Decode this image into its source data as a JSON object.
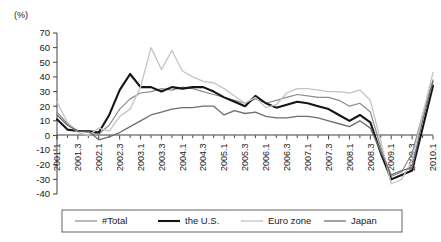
{
  "chart_data": {
    "type": "line",
    "title": "",
    "subtitle": "",
    "xlabel": "",
    "ylabel": "",
    "yunit": "(%)",
    "ylim": [
      -40,
      70
    ],
    "ytick_labels": [
      "70",
      "60",
      "50",
      "40",
      "30",
      "20",
      "10",
      "0",
      "-10",
      "-20",
      "-30",
      "-40"
    ],
    "ytick_values": [
      70,
      60,
      50,
      40,
      30,
      20,
      10,
      0,
      -10,
      -20,
      -30,
      -40
    ],
    "grid": false,
    "legend_position": "bottom",
    "categories": [
      "2001.1",
      "2001.2",
      "2001.3",
      "2001.4",
      "2002.1",
      "2002.2",
      "2002.3",
      "2002.4",
      "2003.1",
      "2003.2",
      "2003.3",
      "2003.4",
      "2004.1",
      "2004.2",
      "2004.3",
      "2004.4",
      "2005.1",
      "2005.2",
      "2005.3",
      "2005.4",
      "2006.1",
      "2006.2",
      "2006.3",
      "2006.4",
      "2007.1",
      "2007.2",
      "2007.3",
      "2007.4",
      "2008.1",
      "2008.2",
      "2008.3",
      "2008.4",
      "2009.1",
      "2009.2",
      "2009.3",
      "2009.4",
      "2010.1"
    ],
    "xtick_labels": [
      "2001.1",
      "2001.3",
      "2002.1",
      "2002.3",
      "2003.1",
      "2003.3",
      "2004.1",
      "2004.3",
      "2005.1",
      "2005.3",
      "2006.1",
      "2006.3",
      "2007.1",
      "2007.3",
      "2008.1",
      "2008.3",
      "2009.1",
      "2009.3",
      "2010.1"
    ],
    "series": [
      {
        "name": "#Total",
        "color": "#8c8c8c",
        "width": 1.2,
        "values": [
          16,
          8,
          3,
          2,
          1,
          7,
          18,
          25,
          29,
          30,
          32,
          31,
          33,
          32,
          30,
          28,
          26,
          24,
          22,
          25,
          22,
          24,
          26,
          28,
          27,
          26,
          26,
          24,
          20,
          22,
          16,
          -8,
          -28,
          -25,
          -12,
          14,
          38
        ]
      },
      {
        "name": "the U.S.",
        "color": "#141414",
        "width": 2.1,
        "values": [
          11,
          4,
          3,
          3,
          2,
          14,
          31,
          42,
          33,
          33,
          30,
          33,
          32,
          33,
          33,
          30,
          26,
          23,
          20,
          27,
          22,
          19,
          21,
          23,
          22,
          20,
          18,
          14,
          10,
          14,
          9,
          -12,
          -30,
          -27,
          -24,
          5,
          34
        ]
      },
      {
        "name": "Euro zone",
        "color": "#c4c4c4",
        "width": 1.3,
        "values": [
          23,
          9,
          2,
          0,
          5,
          3,
          13,
          18,
          33,
          60,
          45,
          58,
          44,
          40,
          37,
          36,
          32,
          27,
          22,
          26,
          19,
          21,
          29,
          32,
          32,
          31,
          30,
          30,
          29,
          31,
          24,
          -4,
          -33,
          -30,
          -17,
          14,
          43
        ]
      },
      {
        "name": "Japan",
        "color": "#6e6e6e",
        "width": 1.3,
        "values": [
          14,
          7,
          3,
          3,
          -3,
          -1,
          2,
          6,
          10,
          14,
          16,
          18,
          19,
          19,
          20,
          20,
          14,
          17,
          15,
          16,
          13,
          12,
          12,
          13,
          13,
          12,
          10,
          8,
          6,
          10,
          5,
          -11,
          -27,
          -24,
          -22,
          10,
          37
        ]
      }
    ],
    "legend": [
      {
        "label": "#Total",
        "color": "#8c8c8c",
        "width": 1.2
      },
      {
        "label": "the U.S.",
        "color": "#141414",
        "width": 2.1
      },
      {
        "label": "Euro zone",
        "color": "#c4c4c4",
        "width": 1.3
      },
      {
        "label": "Japan",
        "color": "#6e6e6e",
        "width": 1.3
      }
    ]
  }
}
